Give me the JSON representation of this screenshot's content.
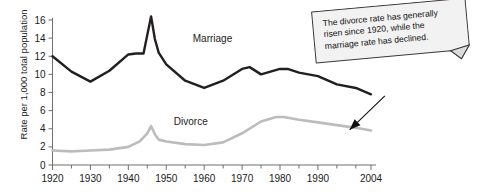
{
  "chart_data": {
    "type": "line",
    "title": "",
    "xlabel": "",
    "ylabel": "Rate per 1,000 total population",
    "xlim": [
      1920,
      2004
    ],
    "ylim": [
      0,
      16
    ],
    "grid": false,
    "legend": "inline-labels",
    "y_ticks": [
      0,
      2,
      4,
      6,
      8,
      10,
      12,
      14,
      16
    ],
    "y_tick_labels": [
      "0",
      "2",
      "4",
      "6",
      "8",
      "10",
      "12",
      "14",
      "16"
    ],
    "x_tick_labels": [
      "1920",
      "1930",
      "1940",
      "1950",
      "1960",
      "1970",
      "1980",
      "1990",
      "2004"
    ],
    "x_tick_values": [
      1920,
      1930,
      1940,
      1950,
      1960,
      1970,
      1980,
      1990,
      2004
    ],
    "x_minor_ticks": [
      1925,
      1935,
      1945,
      1955,
      1965,
      1975,
      1985,
      1995,
      2000
    ],
    "series": [
      {
        "name": "Marriage",
        "color": "#231f20",
        "width": 2.4,
        "label_x": 1957,
        "label_y": 13.6,
        "x": [
          1920,
          1925,
          1930,
          1935,
          1940,
          1942,
          1944,
          1946,
          1947,
          1948,
          1950,
          1955,
          1960,
          1965,
          1970,
          1972,
          1975,
          1980,
          1982,
          1985,
          1990,
          1995,
          2000,
          2004
        ],
        "values": [
          12.0,
          10.3,
          9.2,
          10.4,
          12.2,
          12.3,
          12.3,
          16.4,
          13.9,
          12.4,
          11.1,
          9.3,
          8.5,
          9.3,
          10.6,
          10.8,
          10.0,
          10.6,
          10.6,
          10.2,
          9.8,
          8.9,
          8.5,
          7.8
        ]
      },
      {
        "name": "Divorce",
        "color": "#bcbcbc",
        "width": 2.6,
        "label_x": 1952,
        "label_y": 4.4,
        "x": [
          1920,
          1925,
          1930,
          1935,
          1940,
          1943,
          1945,
          1946,
          1947,
          1948,
          1950,
          1955,
          1960,
          1965,
          1970,
          1975,
          1979,
          1981,
          1985,
          1990,
          1995,
          2000,
          2004
        ],
        "values": [
          1.6,
          1.5,
          1.6,
          1.7,
          2.0,
          2.6,
          3.5,
          4.3,
          3.4,
          2.8,
          2.6,
          2.3,
          2.2,
          2.5,
          3.5,
          4.8,
          5.3,
          5.3,
          5.0,
          4.7,
          4.4,
          4.1,
          3.8
        ]
      }
    ],
    "annotation": {
      "text": "The divorce rate has generally risen since 1920, while the marriage rate has declined.",
      "arrow_from_x": 1995,
      "arrow_from_y": 7.3,
      "arrow_to_x": 2001,
      "arrow_to_y": 4.1
    }
  },
  "axis": {
    "axis_color": "#6f6f6f",
    "background": "#ffffff",
    "text_color": "#1a1a1a"
  }
}
